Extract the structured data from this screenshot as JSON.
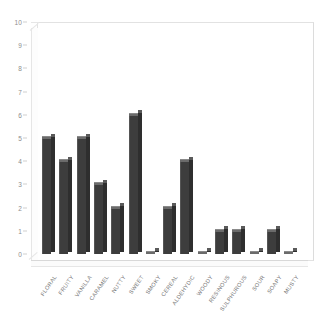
{
  "chart_data": {
    "type": "bar",
    "title": "",
    "subtitle": "",
    "xlabel": "",
    "ylabel": "",
    "ylim": [
      0,
      10
    ],
    "ytick_step": 1,
    "grid": false,
    "legend": null,
    "style": "3d-bars",
    "categories": [
      "FLORAL",
      "FRUITY",
      "VANILLA",
      "CARAMEL",
      "NUTTY",
      "SWEET",
      "SMOKY",
      "CEREAL",
      "ALDEHYDIC",
      "WOODY",
      "RESINOUS",
      "SULPHUROUS",
      "SOUR",
      "SOAPY",
      "MUSTY"
    ],
    "values": [
      5,
      4,
      5,
      3,
      2,
      6,
      0,
      2,
      4,
      0,
      1,
      1,
      0,
      1,
      0
    ],
    "ytick_labels": [
      "0",
      "1",
      "2",
      "3",
      "4",
      "5",
      "6",
      "7",
      "8",
      "9",
      "10"
    ]
  },
  "colors": {
    "bar_front": "#3d3d3d",
    "bar_side": "#2e2e2e",
    "bar_top": "#6b6b6b",
    "frame": "#e2e2e2",
    "axis_text": "#8d8d8d",
    "background": "#ffffff"
  }
}
